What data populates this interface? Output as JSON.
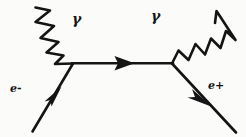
{
  "figure": {
    "kind": "feynman-diagram",
    "background_color": "#fbfbf9",
    "ink_color": "#141414"
  },
  "labels": {
    "electron": "e-",
    "positron": "e+",
    "photon_incoming": "γ",
    "photon_outgoing": "γ"
  },
  "lines": {
    "electron_line": {
      "name": "e-",
      "type": "fermion",
      "from": [
        32,
        131
      ],
      "to": [
        73,
        63
      ],
      "arrow": "up-right",
      "arrow_at": [
        53,
        96
      ]
    },
    "propagator_line": {
      "name": "internal-fermion",
      "type": "fermion",
      "from": [
        73,
        63
      ],
      "to": [
        172,
        63
      ],
      "arrow": "right",
      "arrow_at": [
        124,
        63
      ]
    },
    "positron_line": {
      "name": "e+",
      "type": "fermion",
      "from": [
        172,
        63
      ],
      "to": [
        236,
        132
      ],
      "arrow": "down-right",
      "arrow_at": [
        202,
        97
      ]
    },
    "photon_in_line": {
      "name": "incoming-photon",
      "type": "photon-zigzag",
      "from": [
        36,
        8
      ],
      "to": [
        73,
        63
      ],
      "zigzag_count": 5
    },
    "photon_out_line": {
      "name": "outgoing-photon",
      "type": "photon-zigzag",
      "from": [
        172,
        63
      ],
      "to": [
        217,
        11
      ],
      "zigzag_count": 5
    }
  }
}
